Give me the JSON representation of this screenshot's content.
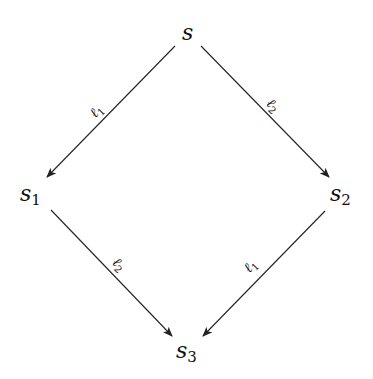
{
  "diagram": {
    "type": "commutative-diamond",
    "nodes": [
      {
        "id": "s",
        "base": "s",
        "sub": ""
      },
      {
        "id": "s1",
        "base": "s",
        "sub": "1"
      },
      {
        "id": "s2",
        "base": "s",
        "sub": "2"
      },
      {
        "id": "s3",
        "base": "s",
        "sub": "3"
      }
    ],
    "edges": [
      {
        "from": "s",
        "to": "s1",
        "label_base": "ℓ",
        "label_sub": "1"
      },
      {
        "from": "s",
        "to": "s2",
        "label_base": "ℓ",
        "label_sub": "2"
      },
      {
        "from": "s1",
        "to": "s3",
        "label_base": "ℓ",
        "label_sub": "2"
      },
      {
        "from": "s2",
        "to": "s3",
        "label_base": "ℓ",
        "label_sub": "1"
      }
    ],
    "colors": {
      "stroke": "#222222",
      "text": "#111111",
      "background": "#ffffff"
    }
  }
}
